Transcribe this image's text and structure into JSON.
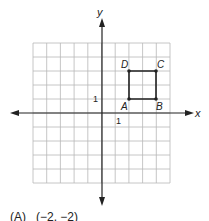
{
  "figure": {
    "axes": {
      "x_label": "x",
      "y_label": "y",
      "x_tick_label": "1",
      "y_tick_label": "1",
      "x_range": [
        -5,
        5
      ],
      "y_range": [
        -5,
        5
      ],
      "grid": true
    },
    "square": {
      "points": [
        {
          "label": "A",
          "x": 2,
          "y": 1
        },
        {
          "label": "B",
          "x": 4,
          "y": 1
        },
        {
          "label": "C",
          "x": 4,
          "y": 3
        },
        {
          "label": "D",
          "x": 2,
          "y": 3
        }
      ]
    },
    "colors": {
      "grid": "#b8b8b8",
      "axis": "#222222",
      "square": "#222222"
    }
  },
  "answer_choice": {
    "text": "(A)   (−2, −2)"
  }
}
